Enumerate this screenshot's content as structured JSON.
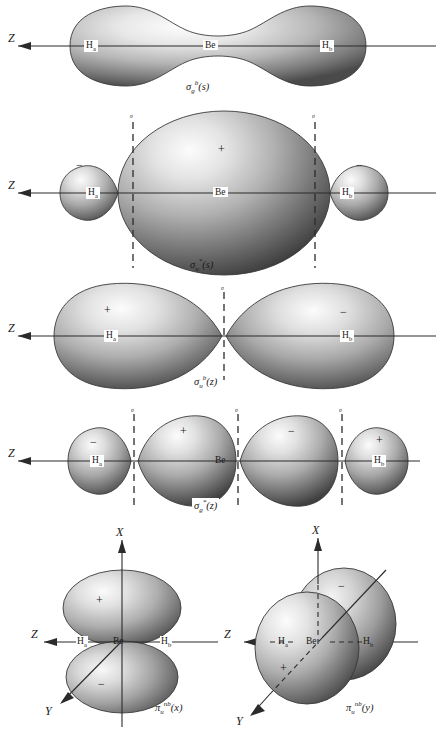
{
  "figure": {
    "background": "#ffffff",
    "ink": "#1a1a1a"
  },
  "axes": {
    "z": "Z",
    "x": "X",
    "y": "Y"
  },
  "atoms": {
    "ha": "H",
    "ha_sub": "a",
    "be": "Be",
    "hb": "H",
    "hb_sub": "b"
  },
  "signs": {
    "plus": "+",
    "minus": "−"
  },
  "node_marker": "σ",
  "orbitals": [
    {
      "id": "sigma-g-b-s",
      "symbol": "σ",
      "sub": "g",
      "sup": "b",
      "arg": "(s)",
      "caption": "σg b(s)",
      "type": "bonding",
      "lobes": [
        {
          "sign": ""
        }
      ],
      "nodes": 0
    },
    {
      "id": "sigma-u-star-s",
      "symbol": "σ",
      "sub": "u",
      "sup": "*",
      "arg": "(s)",
      "caption": "σu *(s)",
      "type": "antibonding",
      "lobes": [
        {
          "sign": "−"
        },
        {
          "sign": "+"
        },
        {
          "sign": "−"
        }
      ],
      "nodes": 2
    },
    {
      "id": "sigma-u-b-z",
      "symbol": "σ",
      "sub": "u",
      "sup": "b",
      "arg": "(z)",
      "caption": "σu b(z)",
      "type": "bonding",
      "lobes": [
        {
          "sign": "+"
        },
        {
          "sign": "−"
        }
      ],
      "nodes": 1
    },
    {
      "id": "sigma-g-star-z",
      "symbol": "σ",
      "sub": "g",
      "sup": "*",
      "arg": "(z)",
      "caption": "σg *(z)",
      "type": "antibonding",
      "lobes": [
        {
          "sign": "−"
        },
        {
          "sign": "+"
        },
        {
          "sign": "−"
        },
        {
          "sign": "+"
        }
      ],
      "nodes": 3
    },
    {
      "id": "pi-u-nb-x",
      "symbol": "π",
      "sub": "u",
      "sup": "nb",
      "arg": "(x)",
      "caption": "πu nb(x)",
      "type": "nonbonding",
      "lobes": [
        {
          "sign": "+"
        },
        {
          "sign": "−"
        }
      ],
      "nodes": 1
    },
    {
      "id": "pi-u-nb-y",
      "symbol": "π",
      "sub": "u",
      "sup": "nb",
      "arg": "(y)",
      "caption": "πu nb(y)",
      "type": "nonbonding",
      "lobes": [
        {
          "sign": "+"
        },
        {
          "sign": "−"
        }
      ],
      "nodes": 1
    }
  ]
}
